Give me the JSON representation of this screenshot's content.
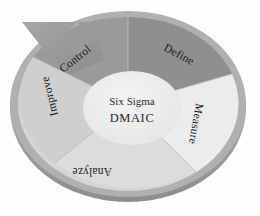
{
  "diagram": {
    "center": {
      "line1": "Six Sigma",
      "line2": "DMAIC"
    },
    "segments": [
      {
        "id": "define",
        "label": "Define",
        "color": "#8f8f8f"
      },
      {
        "id": "measure",
        "label": "Measure",
        "color": "#ececec"
      },
      {
        "id": "analyze",
        "label": "Analyze",
        "color": "#dcdcdc"
      },
      {
        "id": "improve",
        "label": "Improve",
        "color": "#cfcfcf"
      },
      {
        "id": "control",
        "label": "Control",
        "color": "#9a9a9a"
      }
    ],
    "colors": {
      "background": "#fdfdfd",
      "outer_rim": "#a9a9a9",
      "outer_rim_shadow": "#8e8e8e",
      "inner_circle": "#eeeeee",
      "arrow": "#9a9a9a",
      "divider": "#b8b8b8",
      "text": "#1b1b1b"
    },
    "arrow": {
      "name": "cycle-arrow",
      "direction": "counter-clockwise-head-top-left"
    }
  }
}
